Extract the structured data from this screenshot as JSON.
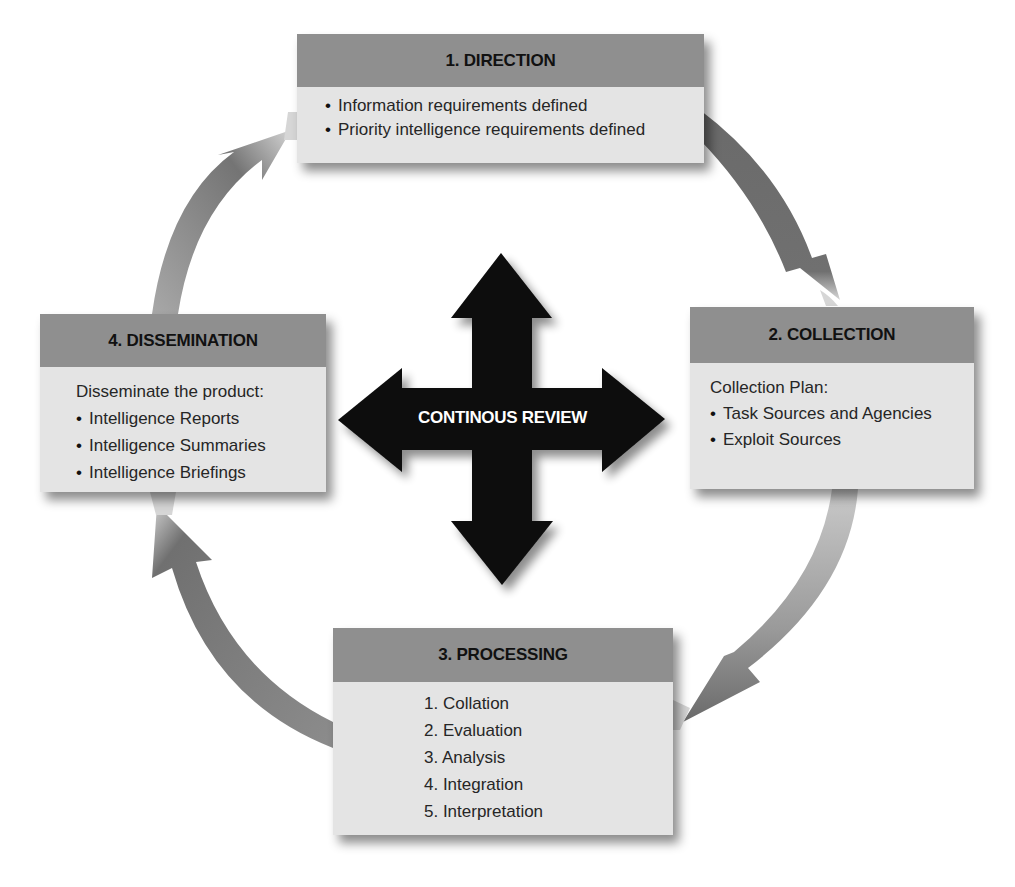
{
  "diagram": {
    "center_label": "CONTINOUS REVIEW",
    "colors": {
      "box_header": "#8f8f8f",
      "box_body": "#e4e4e4",
      "cycle_arrow_dark": "#6e6e6e",
      "cycle_arrow_light": "#d0d0d0",
      "center_cross": "#0a0a0a"
    },
    "stages": [
      {
        "title": "1. DIRECTION",
        "intro": "",
        "items": [
          "Information requirements defined",
          "Priority intelligence requirements defined"
        ]
      },
      {
        "title": "2. COLLECTION",
        "intro": "Collection Plan:",
        "items": [
          "Task Sources and Agencies",
          "Exploit Sources"
        ]
      },
      {
        "title": "3. PROCESSING",
        "intro": "",
        "items": [
          "1. Collation",
          "2. Evaluation",
          "3. Analysis",
          "4. Integration",
          "5. Interpretation"
        ]
      },
      {
        "title": "4. DISSEMINATION",
        "intro": "Disseminate the product:",
        "items": [
          "Intelligence Reports",
          "Intelligence Summaries",
          "Intelligence Briefings"
        ]
      }
    ],
    "flow": [
      {
        "from": "1. DIRECTION",
        "to": "2. COLLECTION"
      },
      {
        "from": "2. COLLECTION",
        "to": "3. PROCESSING"
      },
      {
        "from": "3. PROCESSING",
        "to": "4. DISSEMINATION"
      },
      {
        "from": "4. DISSEMINATION",
        "to": "1. DIRECTION"
      }
    ]
  }
}
